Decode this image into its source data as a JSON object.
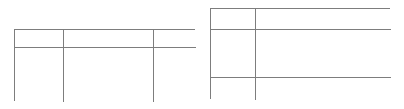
{
  "page": {
    "background_color": "#ffffff",
    "line_color": "#7d7d7d",
    "text_color": "#222222"
  },
  "figures": [
    {
      "id": "figure-left",
      "name": "left-table",
      "position": {
        "x": 14,
        "y": 29,
        "width": 181,
        "height": 72
      },
      "grid": {
        "columns": 3,
        "rows": 2
      },
      "column_widths_px": [
        48,
        90,
        43
      ],
      "row_heights_px": [
        17,
        55
      ],
      "cells": [
        [
          "",
          "",
          ""
        ],
        [
          "",
          "",
          ""
        ]
      ]
    },
    {
      "id": "figure-right",
      "name": "right-table",
      "position": {
        "x": 210,
        "y": 8,
        "width": 180,
        "height": 91
      },
      "grid": {
        "columns": 2,
        "rows": 3
      },
      "column_widths_px": [
        44,
        136
      ],
      "row_heights_px": [
        20,
        48,
        23
      ],
      "cells": [
        [
          "",
          ""
        ],
        [
          "",
          ""
        ],
        [
          "",
          ""
        ]
      ]
    }
  ]
}
